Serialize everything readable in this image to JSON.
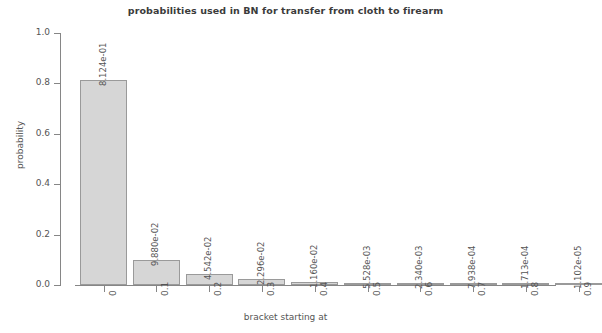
{
  "chart_data": {
    "type": "bar",
    "title": "probabilities used in BN for transfer from cloth to firearm",
    "xlabel": "bracket starting at",
    "ylabel": "probability",
    "categories": [
      "0",
      "0.1",
      "0.2",
      "0.3",
      "0.4",
      "0.5",
      "0.6",
      "0.7",
      "0.8",
      "0.9"
    ],
    "values": [
      0.8124,
      0.0988,
      0.04542,
      0.02296,
      0.0116,
      0.005528,
      0.00234,
      0.0007938,
      0.0001713,
      1.102e-05
    ],
    "value_labels": [
      "8.124e-01",
      "9.880e-02",
      "4.542e-02",
      "2.296e-02",
      "1.160e-02",
      "5.528e-03",
      "2.340e-03",
      "7.938e-04",
      "1.713e-04",
      "1.102e-05"
    ],
    "ylim": [
      0.0,
      1.0
    ],
    "yticks": [
      "1.0",
      "0.8",
      "0.6",
      "0.4",
      "0.2",
      "0.0"
    ],
    "ytick_values": [
      1.0,
      0.8,
      0.6,
      0.4,
      0.2,
      0.0
    ],
    "grid": false,
    "legend": "none",
    "bar_fill_color": "#d6d6d6",
    "bar_border_color": "#9a9a9a",
    "axis_color": "#868686",
    "text_color": "#555555"
  }
}
